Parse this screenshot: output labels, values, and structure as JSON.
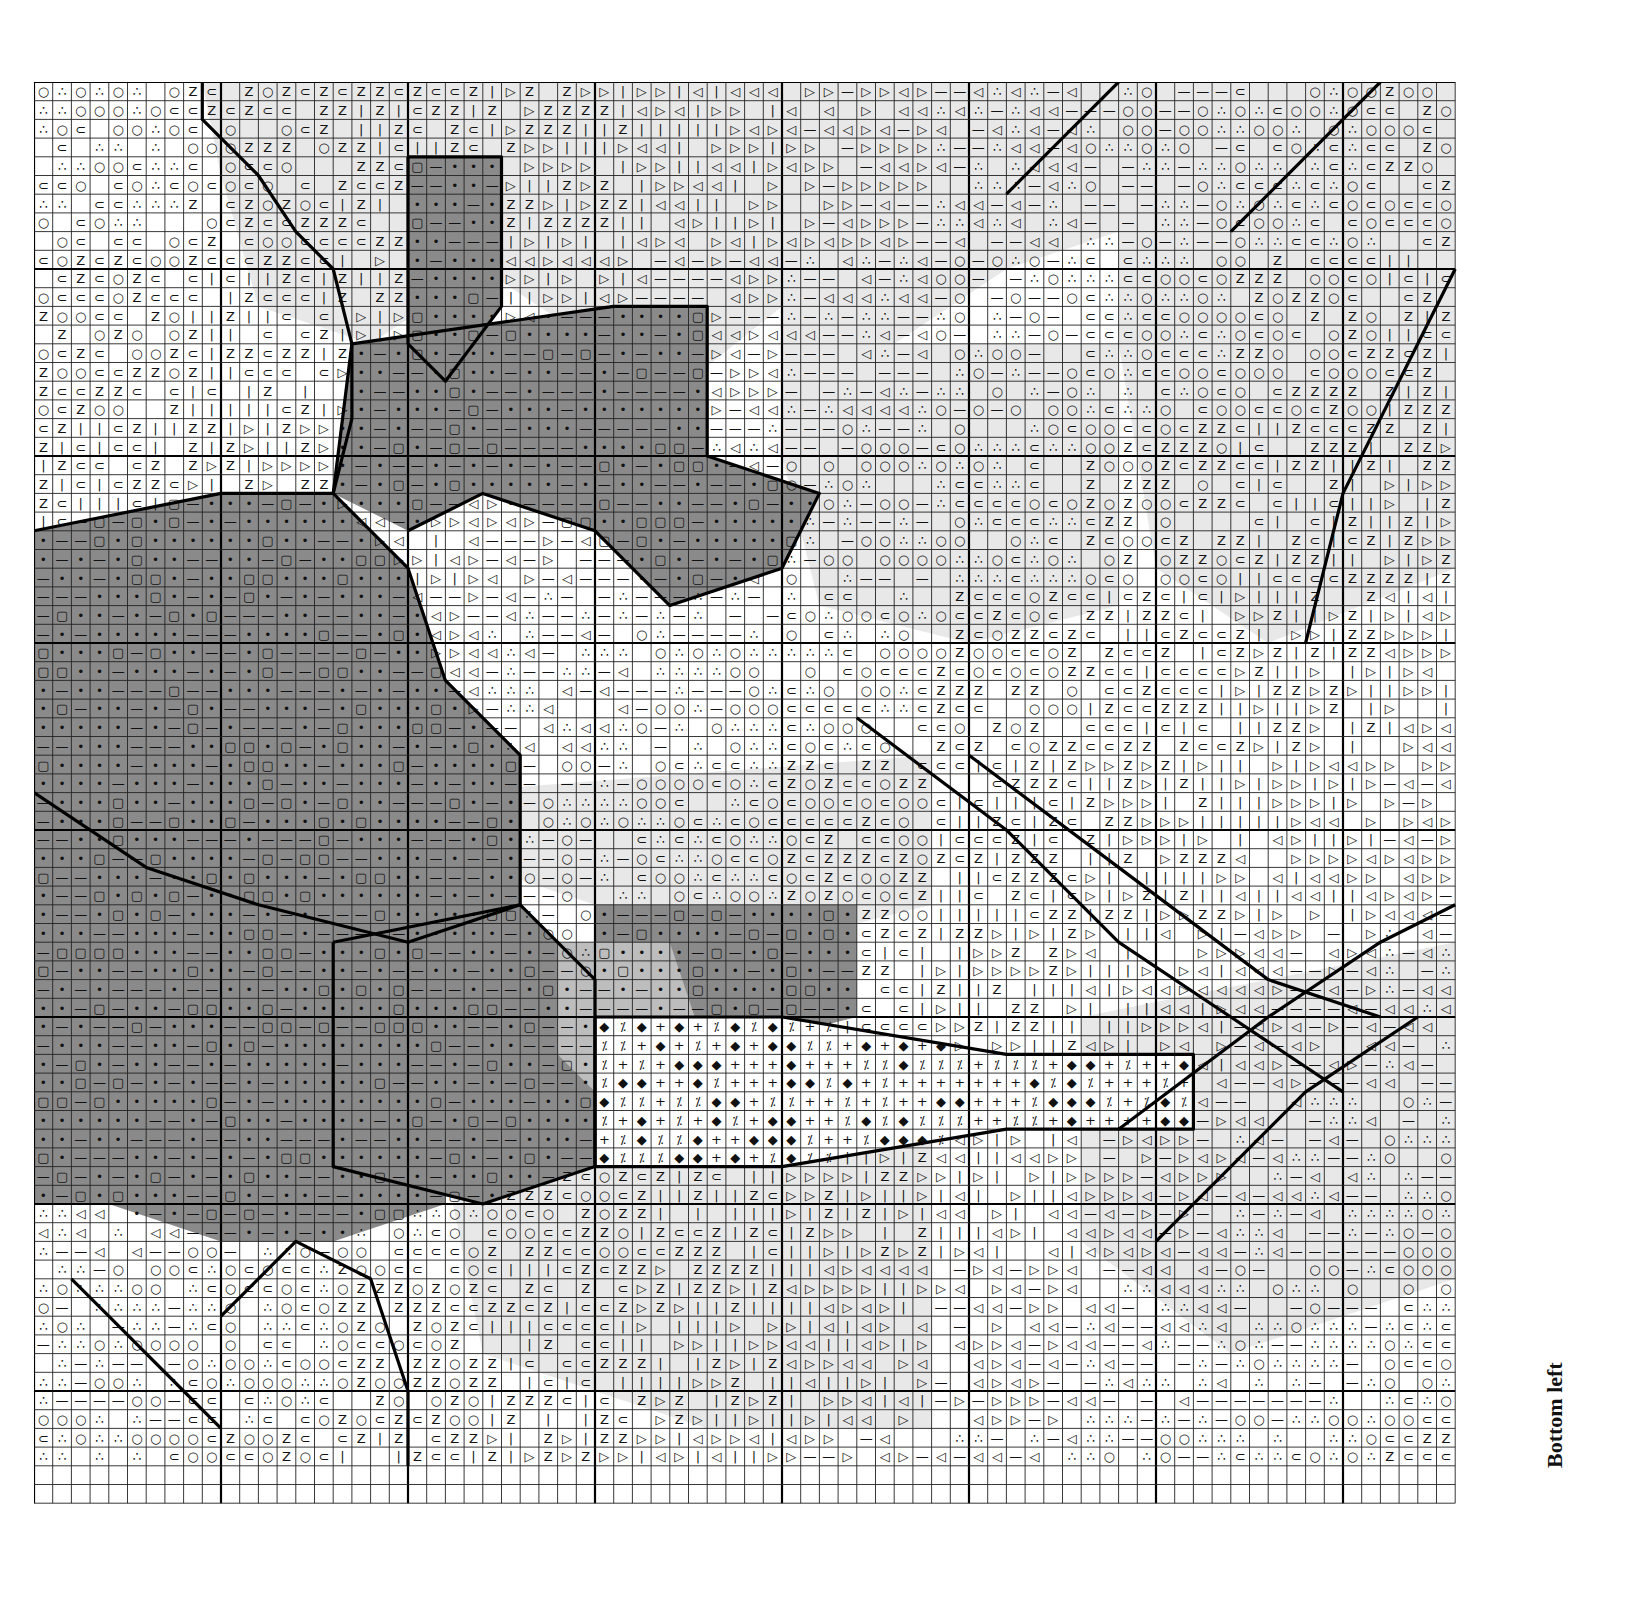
{
  "page": {
    "type": "cross-stitch chart",
    "section_label": "Bottom left"
  },
  "grid": {
    "origin_x": 34,
    "origin_y": 82,
    "cell_size": 18.7,
    "cols": 76,
    "rows": 76,
    "major_every": 10,
    "minor_color": "#222222",
    "major_color": "#000000"
  },
  "palette": {
    "paper": "#ffffff",
    "light_tone": "#e8e8e8",
    "mid_tone": "#bdbdbd",
    "dark_tone": "#8a8a8a",
    "ink": "#111111"
  },
  "symbols": [
    {
      "name": "small-dot",
      "glyph": "•"
    },
    {
      "name": "filled-circle",
      "glyph": "●"
    },
    {
      "name": "open-circle",
      "glyph": "○"
    },
    {
      "name": "triangle-right-open",
      "glyph": "▷"
    },
    {
      "name": "triangle-right-filled",
      "glyph": "▶"
    },
    {
      "name": "triangle-left-open",
      "glyph": "◁"
    },
    {
      "name": "triangle-left-filled",
      "glyph": "◀"
    },
    {
      "name": "three-dots",
      "glyph": "∴"
    },
    {
      "name": "dash",
      "glyph": "—"
    },
    {
      "name": "vertical-bar",
      "glyph": "|"
    },
    {
      "name": "rounded-square",
      "glyph": "▢"
    },
    {
      "name": "diamond-open",
      "glyph": "◇"
    },
    {
      "name": "diamond-filled",
      "glyph": "◆"
    },
    {
      "name": "plus",
      "glyph": "+"
    },
    {
      "name": "dotted-slash",
      "glyph": "⁒"
    },
    {
      "name": "letter-z",
      "glyph": "Z"
    },
    {
      "name": "horseshoe",
      "glyph": "⊂"
    },
    {
      "name": "corner-box",
      "glyph": "⌜"
    },
    {
      "name": "tee",
      "glyph": "⊢"
    },
    {
      "name": "diagonal-line",
      "glyph": "╲"
    },
    {
      "name": "cross-x",
      "glyph": "╳"
    }
  ]
}
